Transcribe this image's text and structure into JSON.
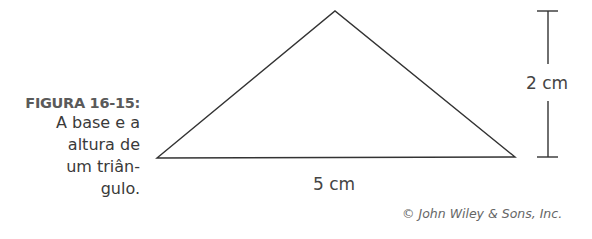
{
  "figure": {
    "label": "FIGURA 16-15:",
    "caption_lines": [
      "A base e a",
      "altura de",
      "um triân-",
      "gulo."
    ]
  },
  "diagram": {
    "shape": "triangle",
    "vertices": [
      [
        157,
        158
      ],
      [
        335,
        11
      ],
      [
        515,
        157
      ]
    ],
    "base_label": "5 cm",
    "height_label": "2 cm"
  },
  "credit": "© John Wiley & Sons, Inc."
}
